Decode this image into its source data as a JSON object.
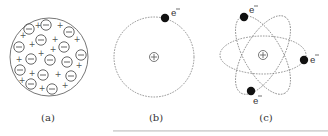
{
  "figure": {
    "panels": [
      {
        "id": "a",
        "label": "(a)",
        "model": "plum-pudding"
      },
      {
        "id": "b",
        "label": "(b)",
        "model": "single-orbit",
        "electron_label": "e⁻"
      },
      {
        "id": "c",
        "label": "(c)",
        "model": "multi-orbit",
        "electron_labels": [
          "e⁻",
          "e⁻",
          "e⁻"
        ]
      }
    ],
    "symbols": {
      "plus": "+",
      "nucleus": "⊕"
    },
    "colors": {
      "stroke": "#555555",
      "electron": "#111111",
      "text": "#333333"
    }
  }
}
